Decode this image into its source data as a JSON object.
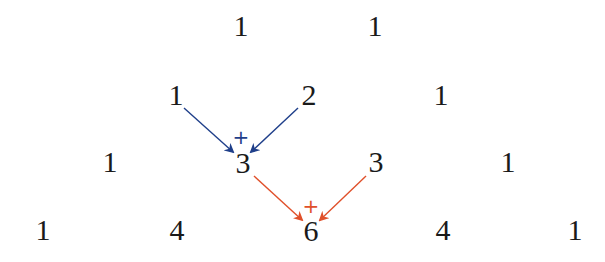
{
  "colors": {
    "text": "#1a1a1a",
    "first_sum_arrows": "#1f3f8a",
    "second_sum_arrows": "#e0502a"
  },
  "rows": [
    {
      "index": 0,
      "values": [
        "1",
        "1"
      ]
    },
    {
      "index": 1,
      "values": [
        "1",
        "2",
        "1"
      ]
    },
    {
      "index": 2,
      "values": [
        "1",
        "3",
        "3",
        "1"
      ]
    },
    {
      "index": 3,
      "values": [
        "1",
        "4",
        "6",
        "4",
        "1"
      ]
    }
  ],
  "annotations": {
    "blue_sum": {
      "operator": "+",
      "inputs": [
        "1",
        "2"
      ],
      "result": "3"
    },
    "orange_sum": {
      "operator": "+",
      "inputs": [
        "3",
        "3"
      ],
      "result": "6"
    }
  }
}
